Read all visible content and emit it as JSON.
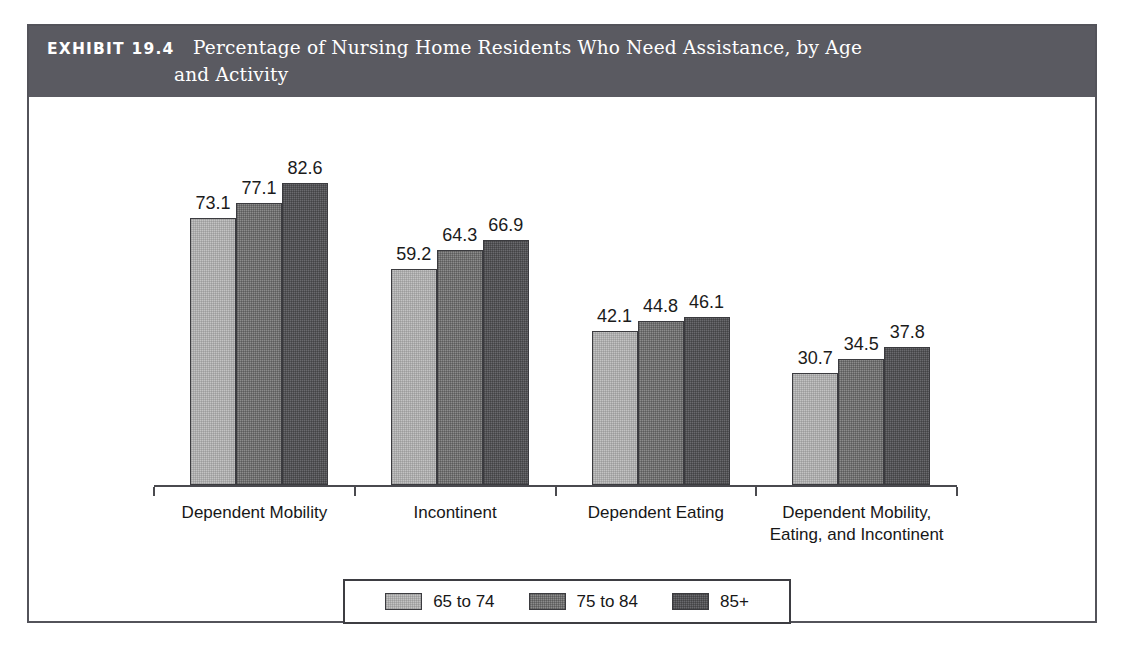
{
  "header": {
    "exhibit_tag": "EXHIBIT 19.4",
    "title_line1": "Percentage of Nursing Home Residents Who Need Assistance, by Age",
    "title_line2": "and Activity",
    "bar_color": "#5a5a61",
    "text_color": "#ffffff"
  },
  "chart_data": {
    "type": "bar",
    "title": "Percentage of Nursing Home Residents Who Need Assistance, by Age and Activity",
    "subtitle": "",
    "xlabel": "",
    "ylabel": "",
    "ylim": [
      0,
      90
    ],
    "grid": false,
    "legend_position": "bottom",
    "value_labels": true,
    "categories": [
      "Dependent Mobility",
      "Incontinent",
      "Dependent Eating",
      "Dependent Mobility,\nEating, and Incontinent"
    ],
    "series": [
      {
        "name": "65 to 74",
        "color": "#c3c3c3",
        "values": [
          73.1,
          59.2,
          42.1,
          30.7
        ]
      },
      {
        "name": "75 to 84",
        "color": "#8c8c8c",
        "values": [
          77.1,
          64.3,
          44.8,
          34.5
        ]
      },
      {
        "name": "85+",
        "color": "#6a6a6e",
        "values": [
          82.6,
          66.9,
          46.1,
          37.8
        ]
      }
    ]
  },
  "legend": {
    "entries": [
      {
        "label": "65 to 74",
        "color": "#c3c3c3"
      },
      {
        "label": "75 to 84",
        "color": "#8c8c8c"
      },
      {
        "label": "85+",
        "color": "#6a6a6e"
      }
    ]
  }
}
